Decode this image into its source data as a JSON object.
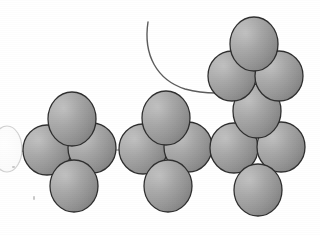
{
  "figure": {
    "title": "Space-filling sphere chain diagram",
    "canvas": {
      "width": 320,
      "height": 235
    },
    "background_color": "#ffffff"
  },
  "style": {
    "sphere_fill_light": "#b4b4b4",
    "sphere_fill_mid": "#9b9b9b",
    "sphere_fill_dark": "#8a8a8a",
    "sphere_outline_color": "#2f2f2f",
    "sphere_outline_width": 1.3,
    "ghost_outline_color": "#d2d2d2",
    "ghost_fill": "#ffffff",
    "arc_stroke_color": "#5c5c5c",
    "arc_stroke_width": 1.4,
    "bond_line_color": "#6e6e6e",
    "bond_line_width": 1.1
  },
  "spheres": [
    {
      "id": "ghost-left-terminal",
      "label": "ghost terminal sphere",
      "cx": 7,
      "cy": 149,
      "rx": 15,
      "ry": 23,
      "variant": "ghost"
    },
    {
      "id": "c1-left",
      "label": "cluster 1 left sphere",
      "cx": 47,
      "cy": 150,
      "rx": 24,
      "ry": 25,
      "variant": "solid"
    },
    {
      "id": "c1-right",
      "label": "cluster 1 right sphere",
      "cx": 92,
      "cy": 148,
      "rx": 24,
      "ry": 25,
      "variant": "solid"
    },
    {
      "id": "c1-top",
      "label": "cluster 1 top sphere",
      "cx": 72,
      "cy": 119,
      "rx": 24,
      "ry": 27,
      "variant": "solid"
    },
    {
      "id": "c1-bottom",
      "label": "cluster 1 bottom sphere",
      "cx": 74,
      "cy": 186,
      "rx": 24,
      "ry": 26,
      "variant": "solid"
    },
    {
      "id": "c2-left",
      "label": "cluster 2 left sphere",
      "cx": 143,
      "cy": 149,
      "rx": 24,
      "ry": 25,
      "variant": "solid"
    },
    {
      "id": "c2-right",
      "label": "cluster 2 right sphere",
      "cx": 188,
      "cy": 147,
      "rx": 24,
      "ry": 25,
      "variant": "solid"
    },
    {
      "id": "c2-top",
      "label": "cluster 2 top sphere",
      "cx": 166,
      "cy": 118,
      "rx": 24,
      "ry": 27,
      "variant": "solid"
    },
    {
      "id": "c2-bottom",
      "label": "cluster 2 bottom sphere",
      "cx": 168,
      "cy": 186,
      "rx": 24,
      "ry": 26,
      "variant": "solid"
    },
    {
      "id": "c3-left",
      "label": "cluster 3 left sphere",
      "cx": 234,
      "cy": 148,
      "rx": 24,
      "ry": 25,
      "variant": "solid"
    },
    {
      "id": "c3-right",
      "label": "cluster 3 right sphere",
      "cx": 281,
      "cy": 147,
      "rx": 24,
      "ry": 25,
      "variant": "solid"
    },
    {
      "id": "c3-bottom",
      "label": "cluster 3 bottom sphere",
      "cx": 258,
      "cy": 190,
      "rx": 24,
      "ry": 26,
      "variant": "solid"
    },
    {
      "id": "c3-center",
      "label": "cluster 3 center sphere",
      "cx": 257,
      "cy": 111,
      "rx": 24,
      "ry": 27,
      "variant": "solid"
    },
    {
      "id": "c4-left",
      "label": "upper cluster left sphere",
      "cx": 232,
      "cy": 76,
      "rx": 24,
      "ry": 25,
      "variant": "solid"
    },
    {
      "id": "c4-right",
      "label": "upper cluster right sphere",
      "cx": 279,
      "cy": 76,
      "rx": 24,
      "ry": 25,
      "variant": "solid"
    },
    {
      "id": "c4-top",
      "label": "upper cluster top sphere",
      "cx": 254,
      "cy": 44,
      "rx": 24,
      "ry": 27,
      "variant": "solid"
    }
  ],
  "bonds": [
    {
      "id": "bond-ghost-c1",
      "label": "ghost to cluster 1 bond",
      "x1": 13,
      "y1": 152,
      "x2": 26,
      "y2": 151
    },
    {
      "id": "bond-c1-c2",
      "label": "cluster 1 to cluster 2 bond",
      "x1": 113,
      "y1": 150,
      "x2": 122,
      "y2": 150
    },
    {
      "id": "bond-c2-c3",
      "label": "cluster 2 to cluster 3 bond",
      "x1": 209,
      "y1": 149,
      "x2": 213,
      "y2": 149
    }
  ],
  "arc": {
    "id": "sweeping-arc",
    "label": "thin curved arc",
    "path": "M 148 22 C 143 55, 157 80, 185 89 C 196 92, 206 93, 216 93",
    "start_point": [
      148,
      22
    ],
    "end_point": [
      216,
      93
    ]
  },
  "specks": [
    {
      "id": "speck-1",
      "label": "scan speck lower left",
      "x": 33,
      "y": 196,
      "w": 2,
      "h": 4
    },
    {
      "id": "speck-2",
      "label": "scan speck left margin",
      "x": 12,
      "y": 166,
      "w": 3,
      "h": 2
    }
  ]
}
